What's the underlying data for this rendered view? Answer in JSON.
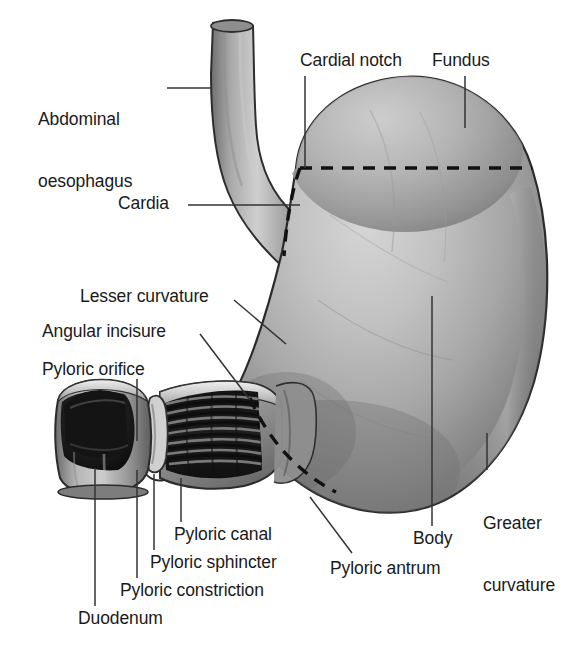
{
  "figure": {
    "view": "anterior view with pyloric region cutaway",
    "background_color": "#ffffff",
    "ink_color": "#1a1a1a"
  },
  "palette": {
    "outline": "#2b2b2b",
    "leader_line": "#333333",
    "dashed_divider": "#111111",
    "tissue_light": "#d8d8d8",
    "tissue_mid": "#b4b4b4",
    "tissue_shadow": "#7c7c7c",
    "tissue_dark": "#5a5a5a",
    "lumen_dark": "#1d1d1d",
    "lumen_black": "#0d0d0d",
    "mucosa_rim": "#e6e6e6",
    "rugae_dark": "#161616",
    "rugae_light": "#9a9a9a"
  },
  "labels": [
    {
      "id": "abdominal-oesophagus",
      "lines": [
        "Abdominal",
        "oesophagus"
      ],
      "text": "Abdominal oesophagus",
      "x": 38,
      "y": 68,
      "align": "left",
      "leader": {
        "type": "horizontal",
        "x1": 167,
        "y1": 88,
        "x2": 210,
        "y2": 88
      }
    },
    {
      "id": "cardial-notch",
      "lines": [
        "Cardial notch"
      ],
      "text": "Cardial notch",
      "x": 300,
      "y": 50,
      "align": "left",
      "leader": {
        "type": "vertical",
        "x1": 305,
        "y1": 74,
        "x2": 305,
        "y2": 168
      }
    },
    {
      "id": "fundus",
      "lines": [
        "Fundus"
      ],
      "text": "Fundus",
      "x": 432,
      "y": 50,
      "align": "left",
      "leader": {
        "type": "vertical",
        "x1": 465,
        "y1": 74,
        "x2": 465,
        "y2": 126
      }
    },
    {
      "id": "cardia",
      "lines": [
        "Cardia"
      ],
      "text": "Cardia",
      "x": 118,
      "y": 193,
      "align": "left",
      "leader": {
        "type": "horizontal",
        "x1": 188,
        "y1": 205,
        "x2": 296,
        "y2": 205
      }
    },
    {
      "id": "lesser-curvature",
      "lines": [
        "Lesser curvature"
      ],
      "text": "Lesser curvature",
      "x": 80,
      "y": 286,
      "align": "left",
      "leader": {
        "type": "diagonal",
        "x1": 234,
        "y1": 300,
        "x2": 284,
        "y2": 342
      }
    },
    {
      "id": "angular-incisure",
      "lines": [
        "Angular incisure"
      ],
      "text": "Angular incisure",
      "x": 42,
      "y": 321,
      "align": "left",
      "leader": {
        "type": "diagonal",
        "x1": 200,
        "y1": 334,
        "x2": 248,
        "y2": 400
      }
    },
    {
      "id": "pyloric-orifice",
      "lines": [
        "Pyloric orifice"
      ],
      "text": "Pyloric orifice",
      "x": 42,
      "y": 359,
      "align": "left",
      "leader": {
        "type": "vertical",
        "x1": 137,
        "y1": 379,
        "x2": 137,
        "y2": 441
      }
    },
    {
      "id": "pyloric-canal",
      "lines": [
        "Pyloric canal"
      ],
      "text": "Pyloric canal",
      "x": 174,
      "y": 524,
      "align": "left",
      "leader": {
        "type": "vertical",
        "x1": 181,
        "y1": 478,
        "x2": 181,
        "y2": 522
      }
    },
    {
      "id": "pyloric-sphincter",
      "lines": [
        "Pyloric sphincter"
      ],
      "text": "Pyloric sphincter",
      "x": 150,
      "y": 552,
      "align": "left",
      "leader": {
        "type": "vertical",
        "x1": 154,
        "y1": 474,
        "x2": 154,
        "y2": 550
      }
    },
    {
      "id": "pyloric-constriction",
      "lines": [
        "Pyloric constriction"
      ],
      "text": "Pyloric constriction",
      "x": 120,
      "y": 580,
      "align": "left",
      "leader": {
        "type": "vertical",
        "x1": 137,
        "y1": 470,
        "x2": 137,
        "y2": 578
      }
    },
    {
      "id": "duodenum",
      "lines": [
        "Duodenum"
      ],
      "text": "Duodenum",
      "x": 78,
      "y": 608,
      "align": "left",
      "leader": {
        "type": "vertical",
        "x1": 95,
        "y1": 468,
        "x2": 95,
        "y2": 606
      }
    },
    {
      "id": "pyloric-antrum",
      "lines": [
        "Pyloric antrum"
      ],
      "text": "Pyloric antrum",
      "x": 330,
      "y": 558,
      "align": "left",
      "leader": {
        "type": "diagonal",
        "x1": 352,
        "y1": 553,
        "x2": 310,
        "y2": 497
      }
    },
    {
      "id": "body",
      "lines": [
        "Body"
      ],
      "text": "Body",
      "x": 413,
      "y": 528,
      "align": "left",
      "leader": {
        "type": "vertical",
        "x1": 432,
        "y1": 526,
        "x2": 432,
        "y2": 296
      }
    },
    {
      "id": "greater-curvature",
      "lines": [
        "Greater",
        "curvature"
      ],
      "text": "Greater curvature",
      "x": 483,
      "y": 472,
      "align": "left",
      "leader": {
        "type": "vertical",
        "x1": 487,
        "y1": 470,
        "x2": 487,
        "y2": 433
      }
    }
  ],
  "regions": [
    {
      "id": "fundus-region",
      "name": "Fundus"
    },
    {
      "id": "body-region",
      "name": "Body"
    },
    {
      "id": "pyloric-antrum-region",
      "name": "Pyloric antrum"
    },
    {
      "id": "pyloric-canal-region",
      "name": "Pyloric canal"
    },
    {
      "id": "cardia-region",
      "name": "Cardia"
    },
    {
      "id": "duodenum-region",
      "name": "Duodenum"
    },
    {
      "id": "oesophagus-region",
      "name": "Abdominal oesophagus"
    }
  ],
  "dividers": [
    {
      "id": "fundus-body-divider",
      "style": "dashed",
      "orientation": "horizontal"
    },
    {
      "id": "body-antrum-divider",
      "style": "dashed",
      "orientation": "curved"
    },
    {
      "id": "cardia-divider",
      "style": "dashed",
      "orientation": "curved"
    },
    {
      "id": "antrum-pylorus-divider",
      "style": "dashed",
      "orientation": "curved"
    }
  ]
}
